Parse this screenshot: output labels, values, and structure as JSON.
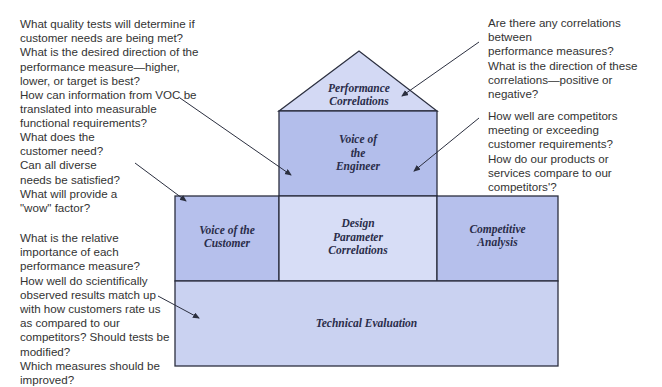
{
  "diagram": {
    "colors": {
      "roof": "#d3d9f4",
      "voice_of_engineer": "#b3beeb",
      "voice_of_customer": "#b6c0ec",
      "design_parameter": "#d7ddf6",
      "competitive_analysis": "#b6c0ec",
      "technical_evaluation": "#cad2f1",
      "outline": "#2b2f3f",
      "arrow": "#2b2f3f"
    },
    "sections": {
      "performance_correlations": "Performance\nCorrelations",
      "voice_of_engineer": "Voice of\nthe\nEngineer",
      "voice_of_customer": "Voice of the\nCustomer",
      "design_parameter_correlations": "Design\nParameter\nCorrelations",
      "competitive_analysis": "Competitive\nAnalysis",
      "technical_evaluation": "Technical Evaluation"
    },
    "annotations": {
      "engineer_questions": "What quality tests will determine if\ncustomer needs are being met?\nWhat is the desired direction of the\nperformance measure—higher,\nlower, or target is best?\nHow can information from VOC be\ntranslated into measurable\nfunctional requirements?",
      "customer_questions": "What does the\ncustomer need?\nCan all diverse\nneeds be satisfied?\nWhat will provide a\n\"wow\" factor?",
      "evaluation_questions": "What is the relative\nimportance of each\nperformance measure?\nHow well do scientifically\nobserved results match up\nwith how customers rate us\nas compared to our\ncompetitors? Should tests be\nmodified?\nWhich measures should be\nimproved?",
      "correlation_questions": "Are there any correlations between\nperformance measures?\nWhat is the direction of these\ncorrelations—positive or negative?",
      "competitor_questions": "How well are competitors\nmeeting or exceeding\ncustomer requirements?\nHow do our products or\nservices compare to our\ncompetitors'?"
    }
  }
}
